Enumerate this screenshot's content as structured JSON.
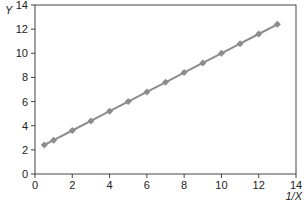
{
  "chart_data": {
    "type": "line",
    "title": "",
    "xlabel": "1/X",
    "ylabel": "Y",
    "xlim": [
      0,
      14
    ],
    "ylim": [
      0,
      14
    ],
    "xticks": [
      0,
      2,
      4,
      6,
      8,
      10,
      12,
      14
    ],
    "yticks": [
      0,
      2,
      4,
      6,
      8,
      10,
      12,
      14
    ],
    "grid": false,
    "legend": null,
    "series": [
      {
        "name": "Y vs 1/X",
        "marker": "diamond",
        "color": "#8c8c8c",
        "x": [
          0.5,
          1,
          2,
          3,
          4,
          5,
          6,
          7,
          8,
          9,
          10,
          11,
          12,
          13
        ],
        "y": [
          2.4,
          2.8,
          3.6,
          4.4,
          5.2,
          6.0,
          6.8,
          7.6,
          8.4,
          9.2,
          10.0,
          10.8,
          11.6,
          12.4
        ]
      }
    ]
  },
  "axis_labels": {
    "x": "1/X",
    "y": "Y"
  },
  "colors": {
    "line": "#8c8c8c",
    "marker": "#8c8c8c",
    "axis": "#444444",
    "text": "#222222"
  }
}
